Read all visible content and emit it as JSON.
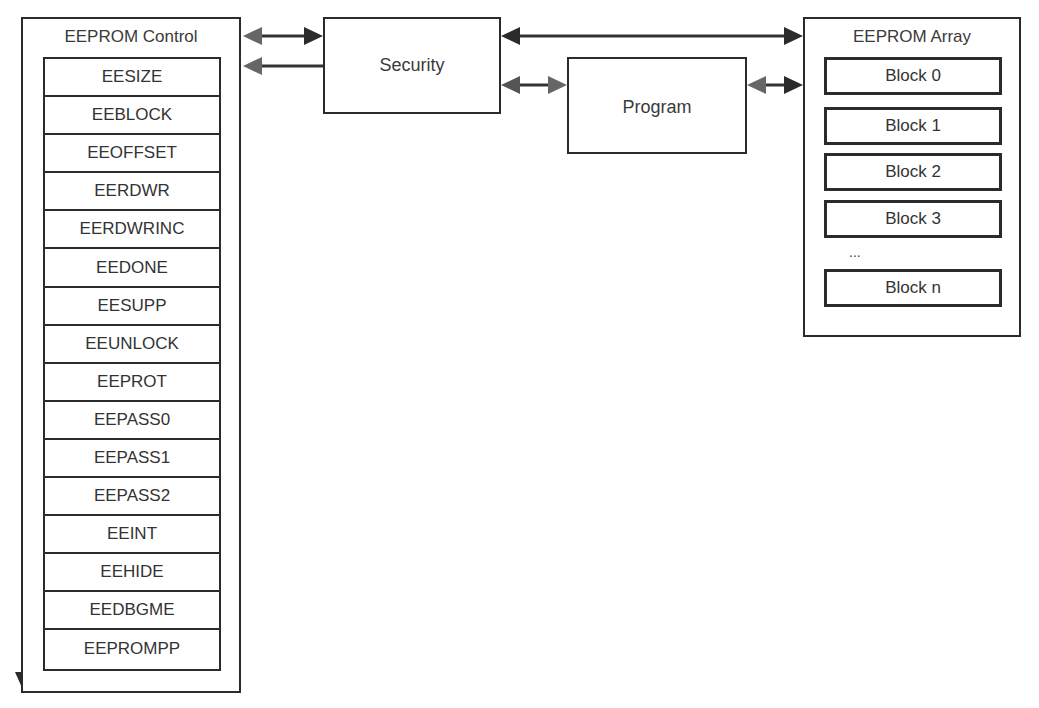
{
  "diagram": {
    "control": {
      "title": "EEPROM Control",
      "registers": [
        "EESIZE",
        "EEBLOCK",
        "EEOFFSET",
        "EERDWR",
        "EERDWRINC",
        "EEDONE",
        "EESUPP",
        "EEUNLOCK",
        "EEPROT",
        "EEPASS0",
        "EEPASS1",
        "EEPASS2",
        "EEINT",
        "EEHIDE",
        "EEDBGME",
        "EEPROMPP"
      ]
    },
    "security": {
      "label": "Security"
    },
    "program": {
      "label": "Program"
    },
    "array": {
      "title": "EEPROM Array",
      "blocks": [
        "Block 0",
        "Block 1",
        "Block 2",
        "Block 3",
        "Block n"
      ],
      "ellipsis": "..."
    },
    "connections": [
      {
        "from": "EEPROM Control",
        "to": "Security",
        "type": "bidirectional"
      },
      {
        "from": "Security",
        "to": "EEPROM Control",
        "type": "unidirectional"
      },
      {
        "from": "Security",
        "to": "EEPROM Array",
        "type": "bidirectional"
      },
      {
        "from": "Security",
        "to": "Program",
        "type": "bidirectional"
      },
      {
        "from": "Program",
        "to": "EEPROM Array",
        "type": "bidirectional"
      },
      {
        "from": "EEPROM Control",
        "to": "EEPROM Control (bottom)",
        "type": "unidirectional"
      }
    ]
  }
}
